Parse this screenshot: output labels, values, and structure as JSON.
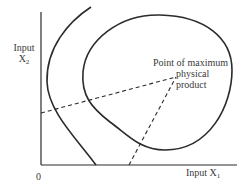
{
  "diagram": {
    "type": "isoquant-ridge-diagram",
    "y_axis": {
      "label_line1": "Input",
      "label_line2_main": "X",
      "label_line2_sub": "2"
    },
    "x_axis": {
      "label_main": "Input X",
      "label_sub": "1"
    },
    "origin_label": "0",
    "annotation": {
      "line1": "Point of maximum",
      "line2": "physical",
      "line3": "product"
    },
    "elements": [
      {
        "name": "outer-isoquant-curve",
        "style": "solid"
      },
      {
        "name": "closed-isoquant-loop",
        "style": "solid"
      },
      {
        "name": "ridge-line-upper",
        "style": "dashed"
      },
      {
        "name": "ridge-line-lower",
        "style": "dashed"
      }
    ],
    "colors": {
      "line": "#2b2b2b",
      "background": "#ffffff"
    }
  }
}
